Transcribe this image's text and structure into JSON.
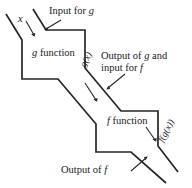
{
  "diagram": {
    "stroke_color": "#262626",
    "background_color": "#ffffff",
    "input_variable": "x",
    "boxes": [
      {
        "id": "g-box",
        "label": "g function",
        "label_italic_part": "g",
        "label_rest": " function"
      },
      {
        "id": "f-box",
        "label": "f function",
        "label_italic_part": "f",
        "label_rest": " function"
      }
    ],
    "channel_labels": [
      {
        "id": "g-of-x",
        "text": "g(x)",
        "rotation_deg": -62
      },
      {
        "id": "f-of-g-of-x",
        "text": "f(g(x))",
        "rotation_deg": -62
      }
    ],
    "annotations": [
      {
        "id": "input-for-g",
        "line1": "Input for ",
        "italic1": "g",
        "line2": "",
        "italic2": ""
      },
      {
        "id": "output-of-g-input-for-f",
        "line1": "Output of ",
        "italic1": "g",
        "line1_tail": " and",
        "line2": "input for ",
        "italic2": "f"
      },
      {
        "id": "f-function-pointer",
        "line1": "",
        "italic1": "",
        "line2": "",
        "italic2": ""
      },
      {
        "id": "output-of-f",
        "line1": "Output of ",
        "italic1": "f",
        "line2": "",
        "italic2": ""
      }
    ]
  }
}
